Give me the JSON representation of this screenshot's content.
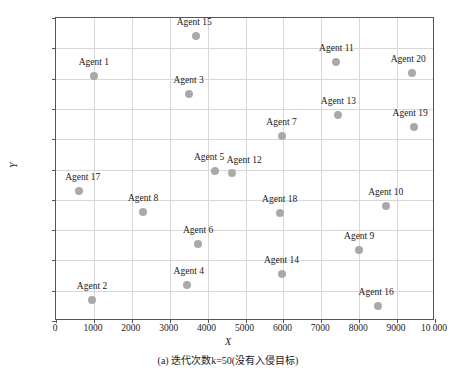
{
  "chart_data": {
    "type": "scatter",
    "title": "",
    "caption": "(a) 迭代次数k=50(没有入侵目标)",
    "xlabel": "X",
    "ylabel": "Y",
    "xlim": [
      0,
      10000
    ],
    "ylim": [
      0,
      10000
    ],
    "grid": true,
    "legend": "none",
    "marker_color": "#a9a9a9",
    "xticks": [
      "0",
      "1000",
      "2000",
      "3000",
      "4000",
      "5000",
      "6000",
      "7000",
      "8000",
      "9000",
      "10 000"
    ],
    "xtick_values": [
      0,
      1000,
      2000,
      3000,
      4000,
      5000,
      6000,
      7000,
      8000,
      9000,
      10000
    ],
    "yticks": [
      "0",
      "1000",
      "2000",
      "3000",
      "4000",
      "5000",
      "6000",
      "7000",
      "8000",
      "9000",
      "10 000"
    ],
    "ytick_values": [
      0,
      1000,
      2000,
      3000,
      4000,
      5000,
      6000,
      7000,
      8000,
      9000,
      10000
    ],
    "points": [
      {
        "label": "Agent 1",
        "x": 1000,
        "y": 8100
      },
      {
        "label": "Agent 2",
        "x": 950,
        "y": 700
      },
      {
        "label": "Agent 3",
        "x": 3500,
        "y": 7500
      },
      {
        "label": "Agent 4",
        "x": 3450,
        "y": 1200
      },
      {
        "label": "Agent 5",
        "x": 4200,
        "y": 4950
      },
      {
        "label": "Agent 6",
        "x": 3750,
        "y": 2550
      },
      {
        "label": "Agent 7",
        "x": 5950,
        "y": 6100
      },
      {
        "label": "Agent 8",
        "x": 2300,
        "y": 3600
      },
      {
        "label": "Agent 9",
        "x": 8000,
        "y": 2350
      },
      {
        "label": "Agent 10",
        "x": 8700,
        "y": 3800
      },
      {
        "label": "Agent 11",
        "x": 7400,
        "y": 8550
      },
      {
        "label": "Agent 12",
        "x": 4650,
        "y": 4900
      },
      {
        "label": "Agent 13",
        "x": 7450,
        "y": 6800
      },
      {
        "label": "Agent 14",
        "x": 5950,
        "y": 1550
      },
      {
        "label": "Agent 15",
        "x": 3700,
        "y": 9400
      },
      {
        "label": "Agent 16",
        "x": 8500,
        "y": 500
      },
      {
        "label": "Agent 17",
        "x": 600,
        "y": 4300
      },
      {
        "label": "Agent 18",
        "x": 5900,
        "y": 3550
      },
      {
        "label": "Agent 19",
        "x": 9450,
        "y": 6400
      },
      {
        "label": "Agent 20",
        "x": 9400,
        "y": 8200
      }
    ],
    "label_offsets": [
      {
        "label": "Agent 1",
        "dx": 0,
        "dy": -9
      },
      {
        "label": "Agent 2",
        "dx": 0,
        "dy": -9
      },
      {
        "label": "Agent 3",
        "dx": 0,
        "dy": -9
      },
      {
        "label": "Agent 4",
        "dx": 2,
        "dy": -9
      },
      {
        "label": "Agent 5",
        "dx": -6,
        "dy": -9
      },
      {
        "label": "Agent 6",
        "dx": 0,
        "dy": -9
      },
      {
        "label": "Agent 7",
        "dx": 0,
        "dy": -9
      },
      {
        "label": "Agent 8",
        "dx": 0,
        "dy": -9
      },
      {
        "label": "Agent 9",
        "dx": 0,
        "dy": -9
      },
      {
        "label": "Agent 10",
        "dx": 0,
        "dy": -9
      },
      {
        "label": "Agent 11",
        "dx": 0,
        "dy": -9
      },
      {
        "label": "Agent 12",
        "dx": 12,
        "dy": -8
      },
      {
        "label": "Agent 13",
        "dx": 0,
        "dy": -9
      },
      {
        "label": "Agent 14",
        "dx": 0,
        "dy": -9
      },
      {
        "label": "Agent 15",
        "dx": -2,
        "dy": -9
      },
      {
        "label": "Agent 16",
        "dx": -2,
        "dy": -9
      },
      {
        "label": "Agent 17",
        "dx": 4,
        "dy": -9
      },
      {
        "label": "Agent 18",
        "dx": 0,
        "dy": -9
      },
      {
        "label": "Agent 19",
        "dx": -4,
        "dy": -9
      },
      {
        "label": "Agent 20",
        "dx": -4,
        "dy": -9
      }
    ]
  }
}
